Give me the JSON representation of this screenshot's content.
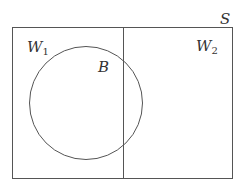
{
  "diagram": {
    "type": "venn",
    "universe_label": "S",
    "regions": [
      {
        "label_main": "W",
        "label_sub": "1"
      },
      {
        "label_main": "W",
        "label_sub": "2"
      }
    ],
    "set_label": "B",
    "colors": {
      "stroke": "#555555",
      "background": "#ffffff",
      "text": "#333333"
    }
  }
}
